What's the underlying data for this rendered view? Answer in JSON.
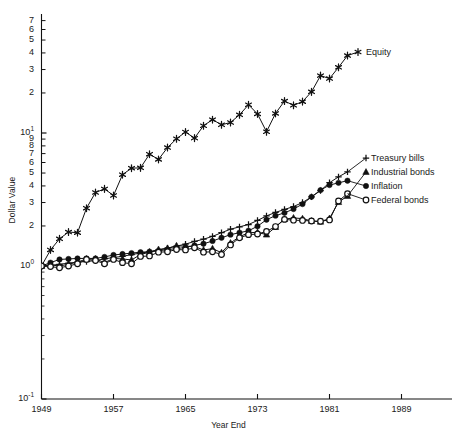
{
  "chart_data": {
    "type": "line",
    "title": "",
    "xlabel": "Year End",
    "ylabel": "Dollar Value",
    "yscale": "log",
    "ylim": [
      0.1,
      90
    ],
    "xlim": [
      1949,
      1993
    ],
    "grid": false,
    "legend_position": "inline-right",
    "y_major_ticks": [
      "10⁰",
      "10¹"
    ],
    "y_minor_ticks": [
      "2",
      "3",
      "4",
      "5",
      "6",
      "7",
      "8",
      "9"
    ],
    "x_ticks": [
      1949,
      1957,
      1965,
      1973,
      1981,
      1989
    ],
    "x": [
      1949,
      1950,
      1951,
      1952,
      1953,
      1954,
      1955,
      1956,
      1957,
      1958,
      1959,
      1960,
      1961,
      1962,
      1963,
      1964,
      1965,
      1966,
      1967,
      1968,
      1969,
      1970,
      1971,
      1972,
      1973,
      1974,
      1975,
      1976,
      1977,
      1978,
      1979,
      1980,
      1981,
      1982,
      1983
    ],
    "series": [
      {
        "name": "Equity",
        "marker": "star",
        "label": "Equity",
        "values": [
          1.0,
          1.32,
          1.6,
          1.8,
          1.78,
          2.72,
          3.57,
          3.8,
          3.39,
          4.86,
          5.44,
          5.47,
          6.93,
          6.33,
          7.77,
          9.05,
          10.17,
          9.15,
          11.34,
          12.6,
          11.53,
          11.99,
          13.7,
          16.3,
          13.91,
          10.22,
          14.03,
          17.39,
          16.15,
          17.21,
          20.39,
          27.0,
          25.66,
          31.17,
          38.2
        ]
      },
      {
        "name": "Treasury bills",
        "marker": "plus",
        "label": "Treasury bills",
        "values": [
          1.0,
          1.01,
          1.03,
          1.05,
          1.07,
          1.08,
          1.1,
          1.13,
          1.16,
          1.18,
          1.22,
          1.25,
          1.28,
          1.32,
          1.36,
          1.41,
          1.46,
          1.53,
          1.59,
          1.67,
          1.78,
          1.89,
          1.97,
          2.05,
          2.2,
          2.38,
          2.53,
          2.66,
          2.8,
          3.0,
          3.31,
          3.69,
          4.23,
          4.68,
          5.1
        ]
      },
      {
        "name": "Industrial bonds",
        "marker": "triangle",
        "label": "Industrial bonds",
        "values": [
          1.0,
          1.02,
          1.0,
          1.03,
          1.07,
          1.13,
          1.13,
          1.06,
          1.14,
          1.13,
          1.11,
          1.22,
          1.27,
          1.33,
          1.36,
          1.42,
          1.41,
          1.4,
          1.32,
          1.35,
          1.26,
          1.49,
          1.66,
          1.78,
          1.79,
          1.72,
          1.96,
          2.25,
          2.3,
          2.27,
          2.18,
          2.15,
          2.28,
          3.02,
          3.36
        ]
      },
      {
        "name": "Inflation",
        "marker": "dot",
        "label": "Inflation",
        "values": [
          1.0,
          1.06,
          1.12,
          1.13,
          1.14,
          1.14,
          1.14,
          1.17,
          1.21,
          1.23,
          1.25,
          1.27,
          1.28,
          1.3,
          1.33,
          1.35,
          1.38,
          1.43,
          1.47,
          1.54,
          1.63,
          1.72,
          1.78,
          1.84,
          1.99,
          2.23,
          2.39,
          2.51,
          2.68,
          2.92,
          3.31,
          3.72,
          4.06,
          4.22,
          4.38
        ]
      },
      {
        "name": "Federal bonds",
        "marker": "circle",
        "label": "Federal bonds",
        "values": [
          1.0,
          0.99,
          0.97,
          1.0,
          1.04,
          1.12,
          1.1,
          1.04,
          1.12,
          1.06,
          1.04,
          1.18,
          1.19,
          1.27,
          1.28,
          1.33,
          1.32,
          1.37,
          1.27,
          1.28,
          1.22,
          1.44,
          1.63,
          1.72,
          1.74,
          1.82,
          1.98,
          2.24,
          2.21,
          2.2,
          2.18,
          2.17,
          2.22,
          3.08,
          3.5
        ]
      }
    ]
  },
  "axis": {
    "ylabel": "Dollar Value",
    "xlabel": "Year End"
  },
  "legend": {
    "equity": "Equity",
    "treasury": "Treasury bills",
    "industrial": "Industrial bonds",
    "inflation": "Inflation",
    "federal": "Federal bonds"
  },
  "y_tick_labels": {
    "t10_1_sup": "1",
    "t10_0_sup": "0",
    "t10_neg1_sup": "-1",
    "base": "10",
    "d9": "9",
    "d8": "8",
    "d7": "7",
    "d6": "6",
    "d5": "5",
    "d4": "4",
    "d3": "3",
    "d2": "2"
  },
  "x_tick_labels": [
    "1949",
    "1957",
    "1965",
    "1973",
    "1981",
    "1989"
  ]
}
